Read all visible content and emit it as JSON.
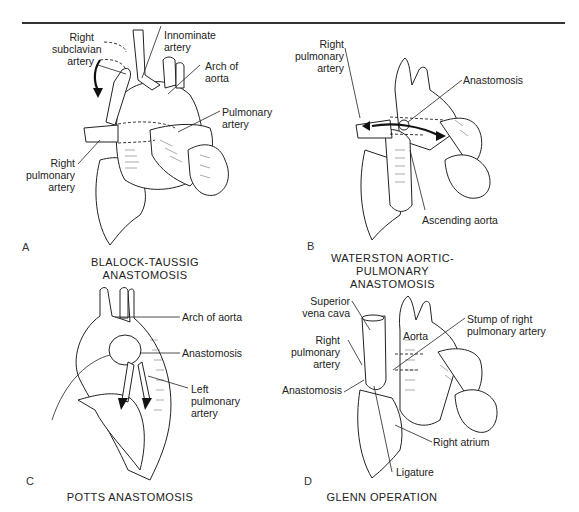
{
  "figure": {
    "panels": [
      {
        "letter": "A",
        "caption": "BLALOCK-TAUSSIG ANASTOMOSIS",
        "labels": {
          "right_subclavian": [
            "Right",
            "subclavian",
            "artery"
          ],
          "innominate": [
            "Innominate",
            "artery"
          ],
          "arch_of_aorta": [
            "Arch of",
            "aorta"
          ],
          "pulmonary_artery": [
            "Pulmonary",
            "artery"
          ],
          "right_pulmonary": [
            "Right",
            "pulmonary",
            "artery"
          ]
        }
      },
      {
        "letter": "B",
        "caption_lines": [
          "WATERSTON AORTIC-",
          "PULMONARY ANASTOMOSIS"
        ],
        "labels": {
          "right_pulmonary": [
            "Right",
            "pulmonary",
            "artery"
          ],
          "anastomosis": "Anastomosis",
          "ascending_aorta": "Ascending aorta"
        }
      },
      {
        "letter": "C",
        "caption": "POTTS ANASTOMOSIS",
        "labels": {
          "arch_of_aorta": "Arch of aorta",
          "anastomosis": "Anastomosis",
          "left_pulmonary": [
            "Left",
            "pulmonary",
            "artery"
          ]
        }
      },
      {
        "letter": "D",
        "caption": "GLENN OPERATION",
        "labels": {
          "superior_vena_cava": [
            "Superior",
            "vena cava"
          ],
          "aorta": "Aorta",
          "stump": [
            "Stump of right",
            "pulmonary artery"
          ],
          "right_pulmonary": [
            "Right",
            "pulmonary",
            "artery"
          ],
          "anastomosis": "Anastomosis",
          "right_atrium": "Right atrium",
          "ligature": "Ligature"
        }
      }
    ]
  }
}
